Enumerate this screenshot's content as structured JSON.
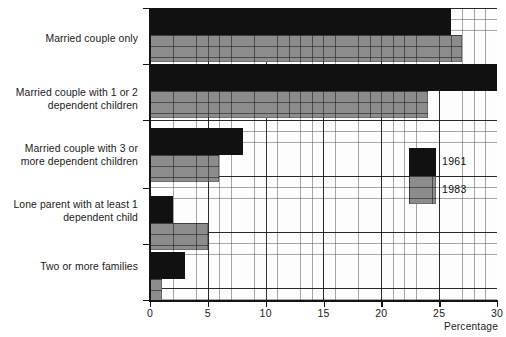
{
  "chart_data": {
    "type": "bar",
    "orientation": "horizontal",
    "title": "",
    "xlabel": "Percentage",
    "ylabel": "",
    "xlim": [
      0,
      30
    ],
    "xticks": [
      0,
      5,
      10,
      15,
      20,
      25,
      30
    ],
    "xtick_labels": [
      "0",
      "5",
      "10",
      "15",
      "20",
      "25",
      "30"
    ],
    "grid": true,
    "legend_position": "inside-right",
    "categories": [
      "Married couple only",
      "Married couple with 1 or 2\ndependent children",
      "Married couple with 3 or\nmore dependent children",
      "Lone parent with at least 1\ndependent child",
      "Two or more families"
    ],
    "series": [
      {
        "name": "1961",
        "color": "#111111",
        "values": [
          26,
          30,
          8,
          2,
          3
        ]
      },
      {
        "name": "1983",
        "color": "#8c8c8c",
        "values": [
          27,
          24,
          6,
          5,
          1
        ]
      }
    ]
  },
  "legend": {
    "items": [
      {
        "label": "1961",
        "color": "#111111"
      },
      {
        "label": "1983",
        "color": "#8c8c8c"
      }
    ]
  },
  "axis": {
    "x_title": "Percentage"
  }
}
